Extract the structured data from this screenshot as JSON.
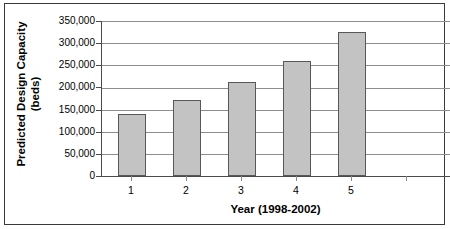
{
  "chart_data": {
    "type": "bar",
    "title": "",
    "xlabel": "Year (1998-2002)",
    "ylabel": "Predicted Design Capacity (beds)",
    "ylabel_line1": "Predicted Design Capacity",
    "ylabel_line2": "(beds)",
    "categories": [
      "1",
      "2",
      "3",
      "4",
      "5"
    ],
    "values": [
      140000,
      171500,
      212000,
      260000,
      325000
    ],
    "series": [
      {
        "name": "Predicted Design Capacity",
        "values": [
          140000,
          171500,
          212000,
          260000,
          325000
        ]
      }
    ],
    "ylim": [
      0,
      350000
    ],
    "ytick_values": [
      0,
      50000,
      100000,
      150000,
      200000,
      250000,
      300000,
      350000
    ],
    "ytick_labels": [
      "0",
      "50,000",
      "100,000",
      "150,000",
      "200,000",
      "250,000",
      "300,000",
      "350,000"
    ],
    "grid": true,
    "grid_axis": "y",
    "legend": false,
    "legend_position": "none",
    "bar_fill_color": "#c3c3c3",
    "bar_border_color": "#585858",
    "gridline_color": "#8d8d8d",
    "axis_color": "#4a4a4a",
    "frame_color": "#3a3a3a",
    "background_color": "#ffffff",
    "text_color": "#000000"
  }
}
